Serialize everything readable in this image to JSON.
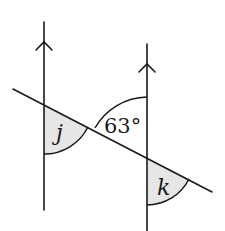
{
  "diagram": {
    "type": "parallel-lines-transversal",
    "colors": {
      "stroke": "#1a1a1a",
      "shade": "#e6e6e6",
      "background": "#ffffff"
    },
    "parallel_lines": [
      {
        "name": "left-parallel-line",
        "marker": "arrow-up"
      },
      {
        "name": "right-parallel-line",
        "marker": "arrow-up"
      }
    ],
    "angles": {
      "j": {
        "label": "j",
        "shaded": true
      },
      "given": {
        "label": "63°",
        "shaded": false
      },
      "k": {
        "label": "k",
        "shaded": true
      }
    }
  }
}
